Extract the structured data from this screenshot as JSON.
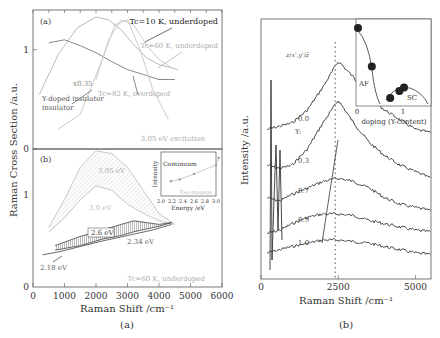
{
  "chart_data": [
    {
      "type": "line",
      "panel": "(a) top",
      "panel_label": "(a)",
      "ylabel": "Raman Cross Section /a.u.",
      "ylim": [
        0,
        1.4
      ],
      "yticks": [
        "0",
        "1"
      ],
      "xlim": [
        0,
        6000
      ],
      "series": [
        {
          "name": "Tc=10 K, underdoped",
          "color": "#bbbbbb",
          "x": [
            200,
            800,
            1400,
            2000,
            2400,
            2800,
            3200,
            3600,
            4000,
            4600
          ],
          "y": [
            0.55,
            0.95,
            1.22,
            1.33,
            1.3,
            1.2,
            1.05,
            0.92,
            0.85,
            0.8
          ]
        },
        {
          "name": "Tc=60 K, underdoped",
          "color": "#cccccc",
          "x": [
            2000,
            2400,
            2800,
            3200,
            3600,
            4000,
            4400
          ],
          "y": [
            0.7,
            1.1,
            1.3,
            1.25,
            1.05,
            0.9,
            0.82
          ]
        },
        {
          "name": "Tc=82 K, overdoped",
          "color": "#888888",
          "x": [
            500,
            1000,
            1500,
            2000,
            2500,
            3000,
            3500,
            4000,
            4500
          ],
          "y": [
            1.07,
            1.1,
            1.04,
            0.97,
            0.88,
            0.8,
            0.75,
            0.7,
            0.7
          ]
        },
        {
          "name": "Y-doped insulator (x0.35)",
          "color": "#cccccc",
          "x": [
            800,
            1500,
            2200,
            2600,
            3000,
            3400,
            3800,
            4300
          ],
          "y": [
            0.2,
            0.35,
            0.9,
            1.25,
            1.3,
            1.0,
            0.6,
            0.3
          ]
        }
      ],
      "annotations": [
        "Tc=10 K, underdoped",
        "Tc=60 K, underdoped",
        "Tc=82 K, overdoped",
        "Y-doped insulator",
        "x0.35",
        "3.05 eV excitation"
      ]
    },
    {
      "type": "area",
      "panel": "(a) bottom",
      "panel_label": "(b)",
      "xlabel": "Raman Shift /cm⁻¹",
      "xlim": [
        0,
        6000
      ],
      "xticks": [
        "0",
        "1000",
        "2000",
        "3000",
        "4000",
        "5000",
        "6000"
      ],
      "ylim": [
        0,
        1.5
      ],
      "yticks": [
        "0",
        "1"
      ],
      "series": [
        {
          "name": "3.05 eV",
          "x": [
            500,
            1000,
            1500,
            2000,
            2500,
            3000,
            3500,
            4000,
            4500
          ],
          "y": [
            0.65,
            0.95,
            1.3,
            1.48,
            1.45,
            1.3,
            1.05,
            0.8,
            0.68
          ]
        },
        {
          "name": "3.0 eV",
          "x": [
            500,
            1000,
            1500,
            2000,
            2500,
            3000,
            3500,
            4000,
            4500
          ],
          "y": [
            0.6,
            0.75,
            0.95,
            1.1,
            1.05,
            0.9,
            0.8,
            0.72,
            0.68
          ]
        },
        {
          "name": "2.6 eV",
          "x": [
            700,
            1500,
            2200,
            2800,
            3200,
            3600,
            4000,
            4400
          ],
          "y": [
            0.45,
            0.55,
            0.62,
            0.68,
            0.72,
            0.7,
            0.68,
            0.7
          ]
        },
        {
          "name": "2.34 eV",
          "x": [
            700,
            1500,
            2200,
            2800,
            3200,
            3600,
            4000,
            4400
          ],
          "y": [
            0.4,
            0.45,
            0.52,
            0.56,
            0.6,
            0.63,
            0.66,
            0.7
          ]
        },
        {
          "name": "2.18 eV",
          "x": [
            300,
            800,
            1500,
            2200,
            3000,
            3800,
            4400
          ],
          "y": [
            0.35,
            0.38,
            0.44,
            0.5,
            0.56,
            0.62,
            0.68
          ]
        }
      ],
      "annotations": [
        "Tc=60 K, underdoped"
      ],
      "inset": {
        "xlabel": "Energy /eV",
        "ylabel": "Intensity",
        "xticks": [
          "2.0",
          "2.2",
          "2.4",
          "2.6",
          "2.8",
          "3.0"
        ],
        "labels": [
          "Continuum",
          "Two-magnon"
        ],
        "continuum_x": [
          2.18,
          2.34,
          2.6,
          3.0,
          3.05
        ],
        "continuum_y": [
          0.3,
          0.35,
          0.5,
          0.75,
          0.95
        ]
      }
    },
    {
      "type": "line",
      "panel": "(b)",
      "xlabel": "Raman Shift /cm⁻¹",
      "ylabel": "Intensity /a.u.",
      "xlim": [
        0,
        5500
      ],
      "xticks": [
        "0",
        "2500",
        "5000"
      ],
      "geometry_label": "z(x',y')z̄",
      "legend_title": "Y:",
      "series": [
        {
          "name": "0.0",
          "x": [
            200,
            600,
            1000,
            1500,
            2000,
            2500,
            3000,
            3500,
            4000,
            4500,
            5000,
            5500
          ],
          "y": [
            4.6,
            4.7,
            4.8,
            5.2,
            5.9,
            6.7,
            6.2,
            5.6,
            5.2,
            4.9,
            4.6,
            4.5
          ]
        },
        {
          "name": "0.3",
          "x": [
            200,
            600,
            1000,
            1500,
            2000,
            2500,
            3000,
            3500,
            4000,
            4500,
            5000,
            5500
          ],
          "y": [
            3.5,
            3.4,
            3.5,
            4.0,
            4.8,
            5.5,
            4.8,
            4.2,
            3.8,
            3.5,
            3.3,
            3.1
          ]
        },
        {
          "name": "0.7",
          "x": [
            200,
            600,
            1000,
            1500,
            2000,
            2500,
            3000,
            3500,
            4000,
            4500,
            5000,
            5500
          ],
          "y": [
            2.5,
            2.4,
            2.6,
            2.8,
            3.0,
            3.1,
            3.0,
            2.8,
            2.5,
            2.3,
            2.2,
            2.1
          ]
        },
        {
          "name": "0.9",
          "x": [
            200,
            600,
            1000,
            1500,
            2000,
            2500,
            3000,
            3500,
            4000,
            4500,
            5000,
            5500
          ],
          "y": [
            1.4,
            1.5,
            1.7,
            1.9,
            2.0,
            2.0,
            1.95,
            1.8,
            1.7,
            1.6,
            1.5,
            1.45
          ]
        },
        {
          "name": "1.0",
          "x": [
            200,
            600,
            1000,
            1500,
            2000,
            2500,
            3000,
            3500,
            4000,
            4500,
            5000,
            5500
          ],
          "y": [
            0.8,
            0.9,
            1.0,
            1.1,
            1.2,
            1.2,
            1.15,
            1.1,
            1.0,
            0.9,
            0.8,
            0.75
          ]
        }
      ],
      "peak_marker_x": 2400,
      "inset": {
        "xlabel": "doping (Y-content)",
        "xticks": [
          "0",
          "1"
        ],
        "labels": [
          "AF",
          "SC"
        ],
        "points_x": [
          0.0,
          0.3,
          0.7,
          0.9,
          1.0
        ],
        "points_y": [
          1.0,
          0.45,
          0.0,
          0.1,
          0.15
        ]
      }
    }
  ],
  "captions": {
    "left": "(a)",
    "right": "(b)"
  }
}
